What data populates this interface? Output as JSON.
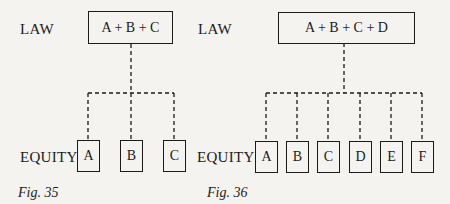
{
  "figures": [
    {
      "caption": "Fig. 35",
      "law_label": "LAW",
      "law_box": "A + B + C",
      "equity_label": "EQUITY",
      "equity_boxes": [
        "A",
        "B",
        "C"
      ]
    },
    {
      "caption": "Fig. 36",
      "law_label": "LAW",
      "law_box": "A + B + C + D",
      "equity_label": "EQUITY",
      "equity_boxes": [
        "A",
        "B",
        "C",
        "D",
        "E",
        "F"
      ]
    }
  ],
  "colors": {
    "ink": "#1b1b1b",
    "paper": "#f4f3ef"
  }
}
